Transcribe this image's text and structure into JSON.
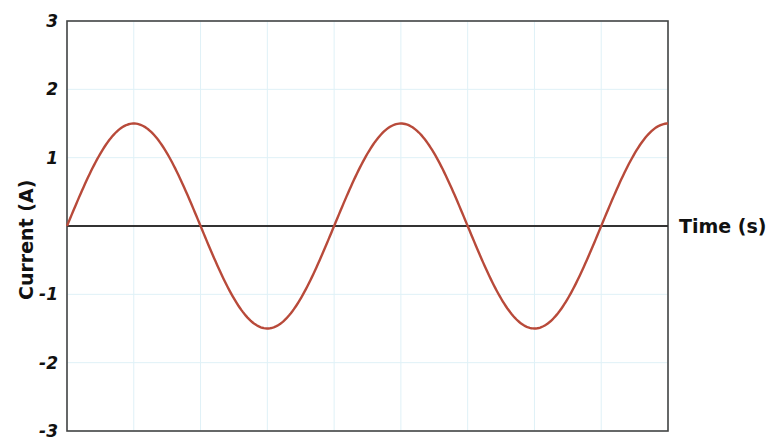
{
  "chart_data": {
    "type": "line",
    "title": "",
    "xlabel": "Time (s)",
    "ylabel": "Current (A)",
    "ylim": [
      -3,
      3
    ],
    "xlim": [
      0,
      2.25
    ],
    "yticks": [
      3,
      2,
      1,
      -1,
      -2,
      -3
    ],
    "ytick_labels": [
      "3",
      "2",
      "1",
      "-1",
      "-2",
      "-3"
    ],
    "grid": true,
    "legend": null,
    "series": [
      {
        "name": "Current",
        "function": "1.5*sin(2*pi*t)",
        "amplitude": 1.5,
        "period_s": 1,
        "color": "#b84a3a",
        "x": [
          0,
          0.25,
          0.5,
          0.75,
          1.0,
          1.25,
          1.5,
          1.75,
          2.0,
          2.25
        ],
        "values": [
          0,
          1.5,
          0,
          -1.5,
          0,
          1.5,
          0,
          -1.5,
          0,
          1.5
        ]
      }
    ]
  },
  "colors": {
    "line": "#b84a3a",
    "grid": "#dff1f7",
    "axis": "#333333",
    "frame": "#444444"
  }
}
